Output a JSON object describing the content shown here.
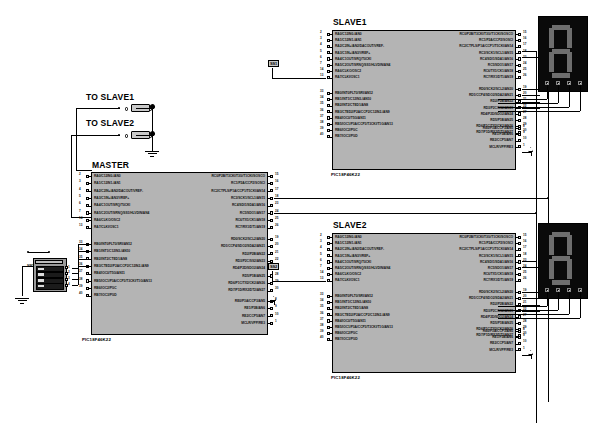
{
  "schematic": {
    "title": "SPI Master-Slave PIC18F46K22 Schematic",
    "part_number": "PIC18F46K22",
    "colors": {
      "chip_fill": "#b4b4b4",
      "wire": "#000000",
      "segment_on": "#6e6e6e",
      "display_bg": "#0a0a0a"
    }
  },
  "chips": [
    {
      "id": "master",
      "title": "MASTER",
      "part": "PIC18F46K22",
      "left_groups": [
        {
          "name": "porta",
          "pins": [
            {
              "num": "2",
              "label": "RA0/C12IN0-/AN0"
            },
            {
              "num": "3",
              "label": "RA1/C12IN1-/AN1"
            },
            {
              "num": "4",
              "label": "RA2/C2IN+/AN2/DACOUT/VREF-"
            },
            {
              "num": "5",
              "label": "RA3/C1IN+/AN3/VREF+"
            },
            {
              "num": "6",
              "label": "RA4/C1OUT/SRQ/T0CKI"
            },
            {
              "num": "7",
              "label": "RA5/C2OUT/SRNQ/SS1/HLVDIN/AN4"
            },
            {
              "num": "14",
              "label": "RA6/CLKO/OSC2"
            },
            {
              "num": "13",
              "label": "RA7/CLKI/OSC1"
            }
          ]
        },
        {
          "name": "portb",
          "pins": [
            {
              "num": "33",
              "label": "RB0/INT0/FLT0/SRI/AN12"
            },
            {
              "num": "34",
              "label": "RB1/INT1/C12IN3-/AN10"
            },
            {
              "num": "35",
              "label": "RB2/INT2/CTED1/AN8"
            },
            {
              "num": "36",
              "label": "RB3/CTED2/P2A/CCP2/C12IN2-/AN9"
            },
            {
              "num": "37",
              "label": "RB4/IOC0/T5G/AN11"
            },
            {
              "num": "38",
              "label": "RB5/IOC1/P3A/CCP3/T3CKI/T1G/AN13"
            },
            {
              "num": "39",
              "label": "RB6/IOC2/PGC"
            },
            {
              "num": "40",
              "label": "RB7/IOC3/PGD"
            }
          ]
        }
      ],
      "right_groups": [
        {
          "name": "portc",
          "pins": [
            {
              "num": "15",
              "label": "RC0/P2B/T3CKI/T3G/T1CKI/SOSCO"
            },
            {
              "num": "16",
              "label": "RC1/P2A/CCP2/SOSCI"
            },
            {
              "num": "17",
              "label": "RC2/CTPLS/P1A/CCP1/T5CKI/AN14"
            },
            {
              "num": "18",
              "label": "RC3/SCK1/SCL1/AN15"
            },
            {
              "num": "23",
              "label": "RC4/SDI1/SDA1/AN16"
            },
            {
              "num": "24",
              "label": "RC5/SDO1/AN17"
            },
            {
              "num": "25",
              "label": "RC6/TX1/CK1/AN18"
            },
            {
              "num": "26",
              "label": "RC7/RX1/DT1/AN19"
            }
          ]
        },
        {
          "name": "portd",
          "pins": [
            {
              "num": "19",
              "label": "RD0/SCK2/SCL2/AN20"
            },
            {
              "num": "20",
              "label": "RD1/CCP4/SDO2/SDA2/AN21"
            },
            {
              "num": "21",
              "label": "RD2/P2B/AN22"
            },
            {
              "num": "22",
              "label": "RD3/P2C/SS2/AN23"
            },
            {
              "num": "27",
              "label": "RD4/P2D/SDO2/AN24"
            },
            {
              "num": "28",
              "label": "RD5/P1B/AN25"
            },
            {
              "num": "29",
              "label": "RD6/P1C/TX2/CK2/AN26"
            },
            {
              "num": "30",
              "label": "RD7/P1D/RX2/DT2/AN27"
            }
          ]
        },
        {
          "name": "porte",
          "pins": [
            {
              "num": "8",
              "label": "RE0/P3A/CCP3/AN5"
            },
            {
              "num": "9",
              "label": "RE1/P3B/AN6"
            },
            {
              "num": "10",
              "label": "RE2/CCP5/AN7"
            },
            {
              "num": "1",
              "label": "MCLR/VPP/RE3"
            }
          ]
        }
      ]
    },
    {
      "id": "slave1",
      "title": "SLAVE1",
      "part": "PIC18F46K22"
    },
    {
      "id": "slave2",
      "title": "SLAVE2",
      "part": "PIC18F46K22"
    }
  ],
  "switches": [
    {
      "id": "sw-slave1",
      "label": "TO SLAVE1"
    },
    {
      "id": "sw-slave2",
      "label": "TO SLAVE2"
    }
  ],
  "net_labels": [
    {
      "id": "ss1",
      "text": "SS1"
    },
    {
      "id": "ss2",
      "text": "SS2"
    }
  ],
  "dip_switch": {
    "reference": "SW1",
    "positions": [
      {
        "num": "1",
        "pin": "33"
      },
      {
        "num": "2",
        "pin": "34"
      },
      {
        "num": "3",
        "pin": "35"
      },
      {
        "num": "4",
        "pin": "36"
      }
    ]
  },
  "displays": [
    {
      "id": "display-slave1",
      "value": "8",
      "segments_on": [
        "a",
        "b",
        "c",
        "d",
        "e",
        "f",
        "g"
      ]
    },
    {
      "id": "display-slave2",
      "value": "8",
      "segments_on": [
        "a",
        "b",
        "c",
        "d",
        "e",
        "f",
        "g"
      ]
    }
  ]
}
